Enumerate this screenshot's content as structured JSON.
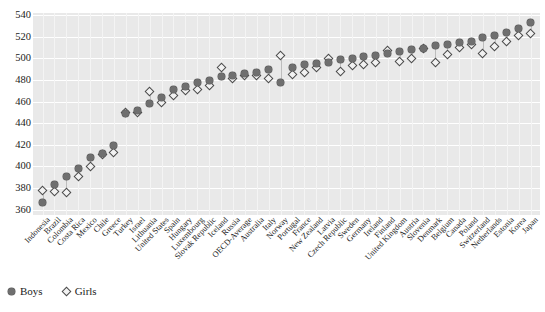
{
  "chart_data": {
    "type": "scatter",
    "title": "",
    "xlabel": "",
    "ylabel": "",
    "ylim": [
      355,
      542
    ],
    "yticks": [
      360,
      380,
      400,
      420,
      440,
      460,
      480,
      500,
      520,
      540
    ],
    "grid": true,
    "legend_position": "bottom-left",
    "categories": [
      "Indonesia",
      "Brazil",
      "Colombia",
      "Costa Rica",
      "Mexico",
      "Chile",
      "Greece",
      "Turkey",
      "Israel",
      "Lithuania",
      "United States",
      "Spain",
      "Hungary",
      "Luxembourg",
      "Slovak Republic",
      "Iceland",
      "Russia",
      "OECD-Average",
      "Australia",
      "Italy",
      "Norway",
      "Portugal",
      "France",
      "New Zealand",
      "Latvia",
      "Czech Republic",
      "Sweden",
      "Germany",
      "Ireland",
      "Finland",
      "United Kingdom",
      "Austria",
      "Slovenia",
      "Denmark",
      "Belgium",
      "Canada",
      "Poland",
      "Switzerland",
      "Netherlands",
      "Estonia",
      "Korea",
      "Japan"
    ],
    "series": [
      {
        "name": "Boys",
        "marker": "filled-circle",
        "color": "#6f6f6f",
        "values": [
          367,
          383,
          391,
          398,
          408,
          412,
          419,
          449,
          452,
          458,
          464,
          471,
          474,
          478,
          480,
          483,
          484,
          486,
          487,
          490,
          478,
          492,
          494,
          495,
          496,
          499,
          500,
          502,
          503,
          505,
          506,
          508,
          509,
          512,
          513,
          515,
          516,
          519,
          521,
          524,
          528,
          533
        ]
      },
      {
        "name": "Girls",
        "marker": "open-diamond",
        "color": "#4a4a4a",
        "values": [
          378,
          377,
          376,
          391,
          400,
          411,
          413,
          450,
          450,
          469,
          459,
          466,
          470,
          471,
          475,
          492,
          481,
          484,
          484,
          481,
          503,
          485,
          487,
          492,
          500,
          488,
          493,
          494,
          496,
          507,
          497,
          500,
          509,
          496,
          504,
          510,
          513,
          505,
          511,
          516,
          521,
          523
        ]
      }
    ]
  },
  "legend": {
    "items": [
      {
        "label": "Boys",
        "marker": "filled-circle"
      },
      {
        "label": "Girls",
        "marker": "open-diamond"
      }
    ]
  },
  "colors": {
    "plot_background": "#e9e9e9",
    "gridline": "#ffffff",
    "boys_marker": "#6f6f6f",
    "girls_marker": "#4a4a4a",
    "stem": "#bdbdbd",
    "text": "#1b1b1b"
  }
}
